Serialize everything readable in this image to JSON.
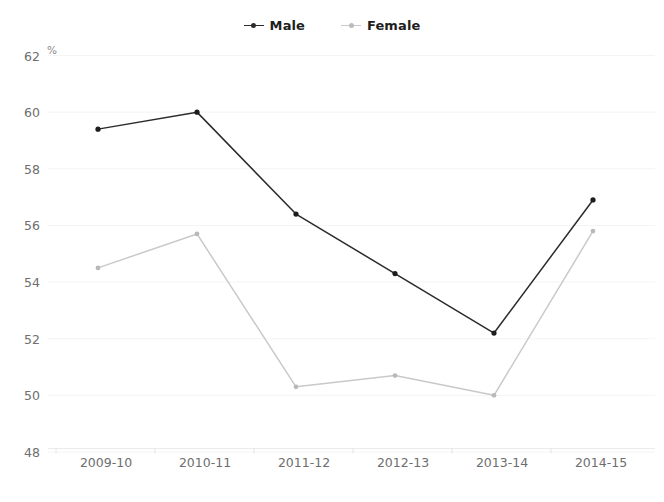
{
  "title_fragment": "SA",
  "legend": {
    "position": "top-center",
    "entries": [
      {
        "label": "Male",
        "color": "#2b2b2b",
        "marker": "line-dot-marker"
      },
      {
        "label": "Female",
        "color": "#c9c9c9",
        "marker": "line-dot-marker"
      }
    ]
  },
  "axis": {
    "y_unit": "%",
    "y_ticks": [
      "48",
      "50",
      "52",
      "54",
      "56",
      "58",
      "60",
      "62"
    ],
    "x_ticks": [
      "2009-10",
      "2010-11",
      "2011-12",
      "2012-13",
      "2013-14",
      "2014-15"
    ]
  },
  "chart_data": {
    "type": "line",
    "title": "",
    "subtitle": "",
    "xlabel": "",
    "ylabel": "%",
    "categories": [
      "2009-10",
      "2010-11",
      "2011-12",
      "2012-13",
      "2013-14",
      "2014-15"
    ],
    "series": [
      {
        "name": "Male",
        "color": "#2b2b2b",
        "values": [
          59.4,
          60.0,
          56.4,
          54.3,
          52.2,
          56.9
        ]
      },
      {
        "name": "Female",
        "color": "#c9c9c9",
        "values": [
          54.5,
          55.7,
          50.3,
          50.7,
          50.0,
          55.8
        ]
      }
    ],
    "ylim": [
      48,
      62
    ],
    "ytick_step": 2,
    "grid": true,
    "grid_axis": "y",
    "legend_position": "top-center",
    "markers": true
  }
}
